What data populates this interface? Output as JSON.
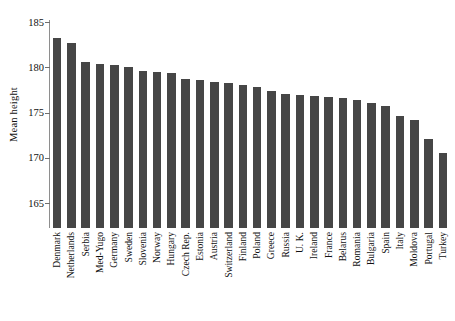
{
  "chart_data": {
    "type": "bar",
    "title": "",
    "subtitle": "",
    "xlabel": "",
    "ylabel": "Mean height",
    "ylim": [
      165,
      185
    ],
    "yticks": [
      165,
      170,
      175,
      180,
      185
    ],
    "ytick_labels": [
      "165",
      "170",
      "175",
      "180",
      "185"
    ],
    "grid": false,
    "legend": null,
    "bar_color": "#464646",
    "axis_color": "#8e8e8e",
    "categories": [
      "Denmark",
      "Netherlands",
      "Serbia",
      "Med-Yugo",
      "Germany",
      "Sweden",
      "Slovenia",
      "Norway",
      "Hungary",
      "Czech Rep.",
      "Estonia",
      "Austria",
      "Switzerland",
      "Finland",
      "Poland",
      "Greece",
      "Russia",
      "U. K.",
      "Ireland",
      "France",
      "Belarus",
      "Romania",
      "Bulgaria",
      "Spain",
      "Italy",
      "Moldova",
      "Portugal",
      "Turkey"
    ],
    "values": [
      183.2,
      182.7,
      180.6,
      180.4,
      180.3,
      180.0,
      179.6,
      179.5,
      179.4,
      178.7,
      178.6,
      178.4,
      178.3,
      178.0,
      177.8,
      177.4,
      177.1,
      176.9,
      176.8,
      176.7,
      176.6,
      176.4,
      176.1,
      175.7,
      174.6,
      174.2,
      172.1,
      170.5
    ]
  }
}
